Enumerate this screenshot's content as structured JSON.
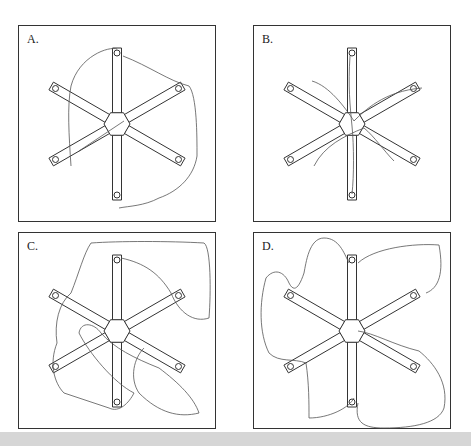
{
  "figure": {
    "panels": [
      {
        "id": "A",
        "label": "A."
      },
      {
        "id": "B",
        "label": "B."
      },
      {
        "id": "C",
        "label": "C."
      },
      {
        "id": "D",
        "label": "D."
      }
    ]
  },
  "colors": {
    "frame": "#333333",
    "arm": "#333333",
    "path": "#555555",
    "band": "#d6d6d6"
  }
}
